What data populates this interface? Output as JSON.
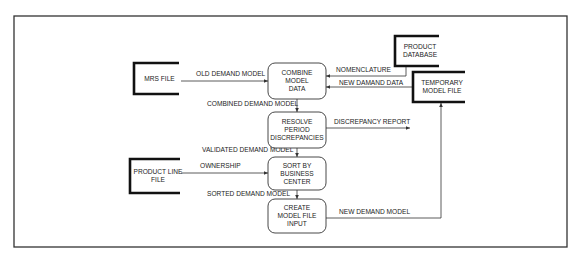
{
  "diagram": {
    "type": "data-flow-diagram",
    "frame": {
      "x": 14,
      "y": 16,
      "w": 553,
      "h": 231
    },
    "processes": [
      {
        "id": "combine",
        "lines": [
          "COMBINE",
          "MODEL",
          "DATA"
        ],
        "x": 268,
        "y": 63,
        "w": 58,
        "h": 36
      },
      {
        "id": "resolve",
        "lines": [
          "RESOLVE",
          "PERIOD",
          "DISCREPANCIES"
        ],
        "x": 268,
        "y": 112,
        "w": 58,
        "h": 36
      },
      {
        "id": "sort",
        "lines": [
          "SORT BY",
          "BUSINESS",
          "CENTER"
        ],
        "x": 268,
        "y": 157,
        "w": 58,
        "h": 33
      },
      {
        "id": "create",
        "lines": [
          "CREATE",
          "MODEL FILE",
          "INPUT"
        ],
        "x": 268,
        "y": 199,
        "w": 58,
        "h": 34
      }
    ],
    "stores": [
      {
        "id": "mrs-file",
        "lines": [
          "MRS FILE"
        ],
        "x": 134,
        "y": 63,
        "w": 45,
        "h": 31,
        "open": "right"
      },
      {
        "id": "product-line-file",
        "lines": [
          "PRODUCT LINE",
          "FILE"
        ],
        "x": 130,
        "y": 159,
        "w": 50,
        "h": 34,
        "open": "right"
      },
      {
        "id": "product-database",
        "lines": [
          "PRODUCT",
          "DATABASE"
        ],
        "x": 395,
        "y": 36,
        "w": 44,
        "h": 30,
        "open": "right"
      },
      {
        "id": "temporary-model-file",
        "lines": [
          "TEMPORARY",
          "MODEL FILE"
        ],
        "x": 413,
        "y": 72,
        "w": 52,
        "h": 30,
        "open": "right"
      }
    ],
    "flows": [
      {
        "id": "old-demand-model",
        "label": "OLD DEMAND MODEL",
        "points": [
          [
            181,
            81
          ],
          [
            268,
            81
          ]
        ],
        "label_x": 196,
        "label_y": 76
      },
      {
        "id": "nomenclature",
        "label": "NOMENCLATURE",
        "points": [
          [
            406,
            66
          ],
          [
            406,
            76
          ],
          [
            326,
            76
          ]
        ],
        "label_x": 336,
        "label_y": 72
      },
      {
        "id": "new-damand-data",
        "label": "NEW DAMAND DATA",
        "points": [
          [
            413,
            87
          ],
          [
            326,
            87
          ]
        ],
        "label_x": 339,
        "label_y": 85
      },
      {
        "id": "combined-demand-model",
        "label": "COMBINED DEMAND MODEL",
        "points": [
          [
            297,
            99
          ],
          [
            297,
            112
          ]
        ],
        "label_x": 207,
        "label_y": 106
      },
      {
        "id": "discrepancy-report",
        "label": "DISCREPANCY REPORT",
        "points": [
          [
            326,
            128
          ],
          [
            410,
            128
          ]
        ],
        "label_x": 334,
        "label_y": 124
      },
      {
        "id": "validated-demand-model",
        "label": "VALIDATED DEMAND MODEL",
        "points": [
          [
            297,
            148
          ],
          [
            297,
            157
          ]
        ],
        "label_x": 202,
        "label_y": 152
      },
      {
        "id": "ownership",
        "label": "OWNERSHIP",
        "points": [
          [
            181,
            173
          ],
          [
            268,
            173
          ]
        ],
        "label_x": 200,
        "label_y": 168
      },
      {
        "id": "sorted-demand-model",
        "label": "SORTED DEMAND MODEL",
        "points": [
          [
            297,
            190
          ],
          [
            297,
            199
          ]
        ],
        "label_x": 207,
        "label_y": 196
      },
      {
        "id": "new-demand-model",
        "label": "NEW DEMAND MODEL",
        "points": [
          [
            326,
            218
          ],
          [
            441,
            218
          ],
          [
            441,
            103
          ]
        ],
        "label_x": 339,
        "label_y": 214
      }
    ]
  },
  "colors": {
    "background": "#ffffff",
    "stroke": "#333333",
    "text": "#222222"
  }
}
